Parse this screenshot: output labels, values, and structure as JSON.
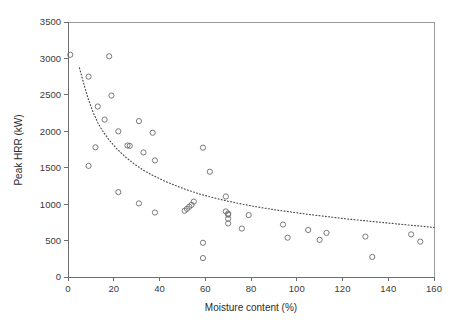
{
  "chart_data": {
    "type": "scatter",
    "title": "",
    "xlabel": "Moisture content (%)",
    "ylabel": "Peak HRR (kW)",
    "xlim": [
      0,
      160
    ],
    "ylim": [
      0,
      3500
    ],
    "xticks": [
      0,
      20,
      40,
      60,
      80,
      100,
      120,
      140,
      160
    ],
    "yticks": [
      0,
      500,
      1000,
      1500,
      2000,
      2500,
      3000,
      3500
    ],
    "xtick_labels": [
      "0",
      "20",
      "40",
      "60",
      "80",
      "100",
      "120",
      "140",
      "160"
    ],
    "ytick_labels": [
      "0",
      "500",
      "1000",
      "1500",
      "2000",
      "2500",
      "3000",
      "3500"
    ],
    "grid": false,
    "legend": null,
    "marker_style": "open-circle",
    "marker_color": "#6b6b6b",
    "series": [
      {
        "name": "Peak HRR vs moisture content",
        "points": [
          [
            1,
            3050
          ],
          [
            18,
            3030
          ],
          [
            9,
            2750
          ],
          [
            19,
            2490
          ],
          [
            13,
            2340
          ],
          [
            16,
            2160
          ],
          [
            31,
            2140
          ],
          [
            22,
            2000
          ],
          [
            37,
            1980
          ],
          [
            26,
            1805
          ],
          [
            27,
            1800
          ],
          [
            12,
            1780
          ],
          [
            33,
            1710
          ],
          [
            59,
            1775
          ],
          [
            38,
            1600
          ],
          [
            9,
            1525
          ],
          [
            62,
            1445
          ],
          [
            22,
            1165
          ],
          [
            69,
            1105
          ],
          [
            31,
            1010
          ],
          [
            55,
            1035
          ],
          [
            54,
            990
          ],
          [
            53,
            965
          ],
          [
            52,
            935
          ],
          [
            51,
            910
          ],
          [
            38,
            885
          ],
          [
            69,
            900
          ],
          [
            70,
            870
          ],
          [
            70,
            855
          ],
          [
            79,
            850
          ],
          [
            70,
            800
          ],
          [
            70,
            735
          ],
          [
            76,
            665
          ],
          [
            94,
            720
          ],
          [
            105,
            645
          ],
          [
            113,
            605
          ],
          [
            110,
            510
          ],
          [
            96,
            540
          ],
          [
            130,
            555
          ],
          [
            150,
            585
          ],
          [
            154,
            485
          ],
          [
            59,
            470
          ],
          [
            133,
            275
          ],
          [
            59,
            260
          ]
        ]
      }
    ],
    "fit_curve": {
      "style": "dotted",
      "color": "#4a4a4a",
      "description": "power-law decay trend line",
      "points": [
        [
          5,
          2870
        ],
        [
          7,
          2640
        ],
        [
          9,
          2430
        ],
        [
          11,
          2260
        ],
        [
          13,
          2120
        ],
        [
          15,
          2010
        ],
        [
          18,
          1880
        ],
        [
          21,
          1770
        ],
        [
          25,
          1650
        ],
        [
          29,
          1550
        ],
        [
          33,
          1465
        ],
        [
          37,
          1395
        ],
        [
          42,
          1320
        ],
        [
          47,
          1255
        ],
        [
          52,
          1195
        ],
        [
          58,
          1135
        ],
        [
          64,
          1085
        ],
        [
          70,
          1040
        ],
        [
          77,
          995
        ],
        [
          84,
          955
        ],
        [
          91,
          920
        ],
        [
          98,
          890
        ],
        [
          105,
          860
        ],
        [
          113,
          830
        ],
        [
          121,
          800
        ],
        [
          129,
          775
        ],
        [
          137,
          750
        ],
        [
          145,
          725
        ],
        [
          152,
          705
        ],
        [
          160,
          680
        ]
      ]
    }
  },
  "axes": {
    "x_title": "Moisture content (%)",
    "y_title": "Peak HRR (kW)"
  }
}
